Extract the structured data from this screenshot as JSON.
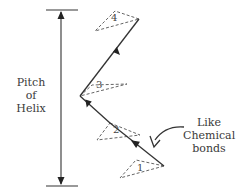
{
  "diagram": {
    "pitch_label": [
      "Pitch",
      "of",
      "Helix"
    ],
    "annotation_label": [
      "Like",
      "Chemical",
      "bonds"
    ],
    "triangle_labels": [
      "1",
      "2",
      "3",
      "4"
    ],
    "colors": {
      "line": "#333333",
      "dashed": "#666666",
      "text": "#3a3a3a",
      "background": "#ffffff"
    }
  }
}
